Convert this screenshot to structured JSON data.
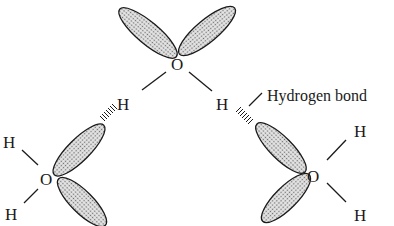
{
  "diagram": {
    "atoms": {
      "oxygen": "O",
      "hydrogen": "H"
    },
    "labels": {
      "hydrogen_bond": "Hydrogen bond"
    },
    "molecules": [
      {
        "id": "top",
        "center": "O",
        "hydrogens": [
          "H",
          "H"
        ],
        "lone_pairs": 2
      },
      {
        "id": "left",
        "center": "O",
        "hydrogens": [
          "H",
          "H"
        ],
        "lone_pairs": 2
      },
      {
        "id": "right",
        "center": "O",
        "hydrogens": [
          "H",
          "H"
        ],
        "lone_pairs": 2
      }
    ],
    "colors": {
      "ink": "#1a1a1a",
      "lobe_fill": "#bdbdbd",
      "background": "#ffffff"
    }
  }
}
